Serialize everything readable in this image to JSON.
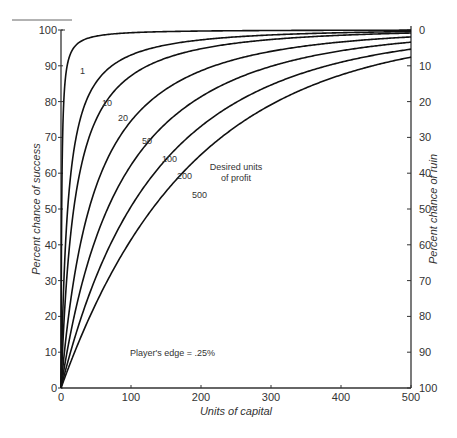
{
  "chart_data": {
    "type": "line",
    "title": "",
    "xlabel": "Units of capital",
    "ylabel": "Percent chance of success",
    "y2label": "Percent chance of ruin",
    "xlim": [
      0,
      500
    ],
    "ylim": [
      0,
      100
    ],
    "y2lim": [
      100,
      0
    ],
    "x_ticks": [
      "0",
      "100",
      "200",
      "300",
      "400",
      "500"
    ],
    "y_ticks": [
      "0",
      "10",
      "20",
      "30",
      "40",
      "50",
      "60",
      "70",
      "80",
      "90",
      "100"
    ],
    "y2_ticks": [
      "100",
      "90",
      "80",
      "70",
      "60",
      "50",
      "40",
      "30",
      "20",
      "10",
      "0"
    ],
    "grid": false,
    "annotations": {
      "edge": "Player's edge = .25%",
      "legend_title_line1": "Desired units",
      "legend_title_line2": "of profit"
    },
    "player_edge": 0.0025,
    "x": [
      0,
      10,
      25,
      50,
      100,
      150,
      200,
      300,
      400,
      500
    ],
    "series": [
      {
        "name": "1",
        "label": "1",
        "values": [
          0,
          91,
          96,
          98,
          99,
          99,
          100,
          100,
          100,
          100
        ]
      },
      {
        "name": "10",
        "label": "10",
        "values": [
          0,
          50,
          71,
          84,
          93,
          96,
          98,
          99,
          100,
          100
        ]
      },
      {
        "name": "20",
        "label": "20",
        "values": [
          0,
          34,
          56,
          73,
          86,
          92,
          95,
          98,
          99,
          100
        ]
      },
      {
        "name": "50",
        "label": "50",
        "values": [
          0,
          17,
          34,
          52,
          71,
          81,
          87,
          94,
          97,
          98
        ]
      },
      {
        "name": "100",
        "label": "100",
        "values": [
          0,
          10,
          22,
          37,
          56,
          68,
          77,
          88,
          94,
          96
        ]
      },
      {
        "name": "200",
        "label": "200",
        "values": [
          0,
          6,
          14,
          26,
          43,
          56,
          66,
          80,
          89,
          93
        ]
      },
      {
        "name": "500",
        "label": "500",
        "values": [
          0,
          4,
          10,
          19,
          34,
          46,
          56,
          72,
          83,
          90
        ]
      }
    ]
  }
}
